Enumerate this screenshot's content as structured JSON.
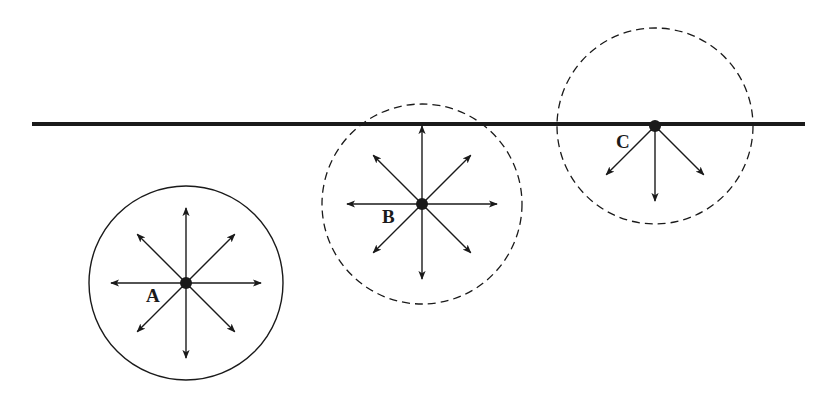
{
  "diagram": {
    "type": "molecule-forces-at-surface",
    "surface_line": {
      "x1": 32,
      "x2": 805,
      "y": 124,
      "thickness": 4,
      "color": "#1a1a1a"
    },
    "molecules": [
      {
        "id": "A",
        "label": "A",
        "cx": 186,
        "cy": 283,
        "r": 97,
        "circle_style": "solid",
        "arrow_directions": [
          "up",
          "up-right",
          "right",
          "down-right",
          "down",
          "down-left",
          "left",
          "up-left"
        ],
        "arrow_length": 75,
        "label_x": 146,
        "label_y": 302
      },
      {
        "id": "B",
        "label": "B",
        "cx": 422,
        "cy": 204,
        "r": 100,
        "circle_style": "dashed",
        "arrow_directions": [
          "up",
          "up-right",
          "right",
          "down-right",
          "down",
          "down-left",
          "left",
          "up-left"
        ],
        "arrow_length": 75,
        "label_x": 382,
        "label_y": 223
      },
      {
        "id": "C",
        "label": "C",
        "cx": 655,
        "cy": 126,
        "r": 98,
        "circle_style": "dashed",
        "arrow_directions": [
          "down-left",
          "down",
          "down-right"
        ],
        "arrow_length": 75,
        "label_x": 616,
        "label_y": 148
      }
    ],
    "colors": {
      "ink": "#1a1a1a",
      "background": "#ffffff"
    }
  }
}
